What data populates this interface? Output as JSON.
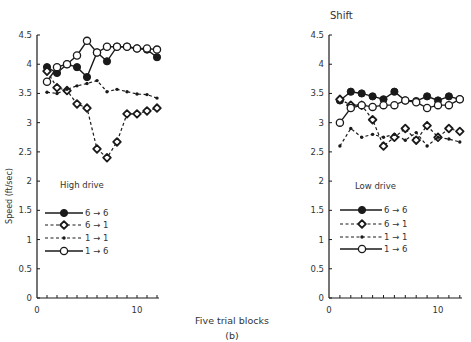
{
  "figure": {
    "xlabel": "Five trial blocks",
    "caption": "(b)",
    "ylabel": "Speed (ft/sec)"
  },
  "chart_data": [
    {
      "type": "line",
      "title": "",
      "annotation": "High drive",
      "xlabel": "Five trial blocks",
      "ylabel": "Speed (ft/sec)",
      "xlim": [
        0,
        12
      ],
      "ylim": [
        0,
        4.5
      ],
      "xticks": [
        0,
        10
      ],
      "yticks": [
        0,
        0.5,
        1,
        1.5,
        2,
        2.5,
        3,
        3.5,
        4,
        4.5
      ],
      "grid": false,
      "legend_position": "lower-left",
      "x": [
        1,
        2,
        3,
        4,
        5,
        6,
        7,
        8,
        9,
        10,
        11,
        12
      ],
      "series": [
        {
          "name": "6 → 6",
          "line": "solid",
          "marker": "filled-circle",
          "values": [
            3.95,
            3.85,
            4.0,
            3.95,
            3.78,
            4.2,
            4.05,
            4.3,
            4.3,
            4.27,
            4.25,
            4.12
          ]
        },
        {
          "name": "6 → 1",
          "line": "dashed",
          "marker": "open-diamond",
          "values": [
            3.88,
            3.6,
            3.55,
            3.32,
            3.25,
            2.55,
            2.4,
            2.67,
            3.15,
            3.15,
            3.2,
            3.25
          ]
        },
        {
          "name": "1 → 1",
          "line": "dashed",
          "marker": "small-dot",
          "values": [
            3.52,
            3.5,
            3.57,
            3.63,
            3.67,
            3.72,
            3.53,
            3.57,
            3.53,
            3.49,
            3.48,
            3.42
          ]
        },
        {
          "name": "1 → 6",
          "line": "solid",
          "marker": "open-circle",
          "values": [
            3.7,
            3.95,
            4.0,
            4.15,
            4.4,
            4.2,
            4.3,
            4.3,
            4.3,
            4.27,
            4.27,
            4.25
          ]
        }
      ]
    },
    {
      "type": "line",
      "title": "Shift",
      "annotation": "Low drive",
      "xlabel": "Five trial blocks",
      "ylabel": "Speed (ft/sec)",
      "xlim": [
        0,
        12
      ],
      "ylim": [
        0,
        4.5
      ],
      "xticks": [
        0,
        10
      ],
      "yticks": [
        0,
        0.5,
        1,
        1.5,
        2,
        2.5,
        3,
        3.5,
        4,
        4.5
      ],
      "grid": false,
      "legend_position": "lower-left",
      "x": [
        1,
        2,
        3,
        4,
        5,
        6,
        7,
        8,
        9,
        10,
        11,
        12
      ],
      "series": [
        {
          "name": "6 → 6",
          "line": "solid",
          "marker": "filled-circle",
          "values": [
            3.38,
            3.53,
            3.5,
            3.45,
            3.4,
            3.53,
            3.38,
            3.37,
            3.45,
            3.38,
            3.45,
            3.4
          ]
        },
        {
          "name": "6 → 1",
          "line": "dashed",
          "marker": "open-diamond",
          "values": [
            3.4,
            3.3,
            3.3,
            3.05,
            2.6,
            2.75,
            2.9,
            2.7,
            2.95,
            2.75,
            2.9,
            2.85
          ]
        },
        {
          "name": "1 → 1",
          "line": "dashed",
          "marker": "small-dot",
          "values": [
            2.6,
            2.9,
            2.75,
            2.8,
            2.75,
            2.8,
            2.7,
            2.83,
            2.6,
            2.75,
            2.72,
            2.67
          ]
        },
        {
          "name": "1 → 6",
          "line": "solid",
          "marker": "open-circle",
          "values": [
            3.0,
            3.25,
            3.3,
            3.27,
            3.3,
            3.3,
            3.38,
            3.35,
            3.25,
            3.3,
            3.3,
            3.4
          ]
        }
      ]
    }
  ]
}
